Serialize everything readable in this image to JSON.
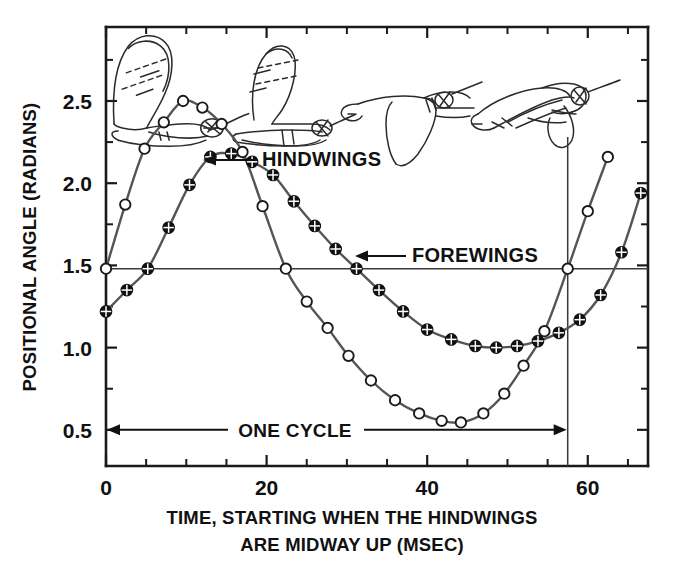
{
  "chart_data": {
    "type": "line",
    "title": "",
    "xlabel": "TIME, STARTING WHEN THE HINDWINGS ARE MIDWAY UP (MSEC)",
    "xlabel_line1": "TIME, STARTING WHEN THE HINDWINGS",
    "xlabel_line2": "ARE MIDWAY UP (MSEC)",
    "ylabel": "POSITIONAL ANGLE (RADIANS)",
    "xlim": [
      0,
      67.5
    ],
    "ylim": [
      0.28,
      2.95
    ],
    "xticks": [
      0,
      5,
      10,
      15,
      20,
      25,
      30,
      35,
      40,
      45,
      50,
      55,
      60,
      65
    ],
    "xtick_labels": [
      "0",
      "",
      "",
      "",
      "20",
      "",
      "",
      "",
      "40",
      "",
      "",
      "",
      "60",
      ""
    ],
    "xtick_labels_shown": [
      "0",
      "20",
      "40",
      "60"
    ],
    "yticks": [
      0.5,
      1.0,
      1.5,
      2.0,
      2.5
    ],
    "ytick_labels": [
      "0.5",
      "1.0",
      "1.5",
      "2.0",
      "2.5"
    ],
    "ytick_minor": [
      0.75,
      1.25,
      1.75,
      2.25,
      2.75
    ],
    "grid": false,
    "legend_position": "inline-annotations",
    "reference_line_y": 1.48,
    "cycle_start_x": 0,
    "cycle_end_x": 57.5,
    "series": [
      {
        "name": "HINDWINGS",
        "marker": "open-circle",
        "x": [
          0,
          2.4,
          4.8,
          7.2,
          9.6,
          12.0,
          14.4,
          17.0,
          19.5,
          22.4,
          25.0,
          27.6,
          30.2,
          33.0,
          36.0,
          39.0,
          41.8,
          44.2,
          47.0,
          49.6,
          52.0,
          54.6,
          57.5,
          60.0,
          62.5
        ],
        "y": [
          1.48,
          1.87,
          2.21,
          2.37,
          2.5,
          2.46,
          2.36,
          2.19,
          1.86,
          1.48,
          1.28,
          1.12,
          0.95,
          0.8,
          0.68,
          0.6,
          0.555,
          0.545,
          0.6,
          0.72,
          0.89,
          1.1,
          1.48,
          1.83,
          2.16
        ]
      },
      {
        "name": "FOREWINGS",
        "marker": "crossed-circle",
        "x": [
          0,
          2.6,
          5.2,
          7.8,
          10.4,
          13.0,
          15.6,
          18.2,
          20.8,
          23.4,
          26.0,
          28.6,
          31.2,
          34.0,
          37.0,
          40.0,
          43.0,
          46.0,
          48.6,
          51.2,
          53.8,
          56.4,
          59.0,
          61.6,
          64.2,
          66.6
        ],
        "y": [
          1.22,
          1.35,
          1.48,
          1.73,
          1.99,
          2.16,
          2.18,
          2.13,
          2.05,
          1.89,
          1.74,
          1.6,
          1.48,
          1.35,
          1.22,
          1.11,
          1.05,
          1.01,
          1.0,
          1.01,
          1.04,
          1.09,
          1.17,
          1.32,
          1.58,
          1.94
        ]
      }
    ],
    "annotations": [
      {
        "text": "HINDWINGS",
        "points_to_series": "HINDWINGS",
        "arrow_direction": "left"
      },
      {
        "text": "FOREWINGS",
        "points_to_series": "FOREWINGS",
        "arrow_direction": "left"
      },
      {
        "text": "ONE CYCLE",
        "arrow_direction": "double",
        "from_x": 0,
        "to_x": 57.5,
        "at_y": 0.5
      }
    ],
    "insect_figures": [
      {
        "label": "wings-up-start",
        "at_x": 4
      },
      {
        "label": "wings-upstroke",
        "at_x": 18
      },
      {
        "label": "wings-down",
        "at_x": 33
      },
      {
        "label": "wings-folded",
        "at_x": 50
      }
    ],
    "colors": {
      "axis": "#1a1a1a",
      "curve": "#555555",
      "marker_open_fill": "#ffffff",
      "marker_filled": "#111111",
      "reference_line": "#3a3a3a",
      "background": "#ffffff"
    }
  }
}
